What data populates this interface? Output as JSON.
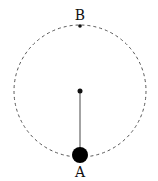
{
  "diagram": {
    "type": "circular-motion",
    "labels": {
      "top": "B",
      "bottom": "A"
    },
    "colors": {
      "ink": "#111111",
      "dash": "#555555",
      "string": "#666666"
    }
  }
}
